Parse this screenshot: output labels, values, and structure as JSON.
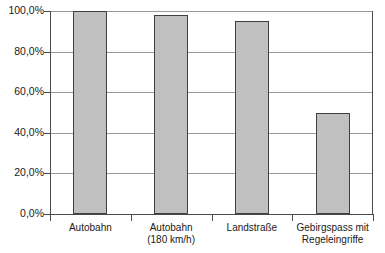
{
  "chart_data": {
    "type": "bar",
    "title": "",
    "subtitle": "",
    "xlabel": "",
    "ylabel": "",
    "categories": [
      "Autobahn",
      "Autobahn (180 km/h)",
      "Landstraße",
      "Gebirgspass mit Regeleingriffe"
    ],
    "category_lines": [
      [
        "Autobahn"
      ],
      [
        "Autobahn",
        "(180 km/h)"
      ],
      [
        "Landstraße"
      ],
      [
        "Gebirgspass mit",
        "Regeleingriffe"
      ]
    ],
    "values": [
      100.0,
      98.0,
      95.0,
      50.0
    ],
    "value_labels": [
      "100,0%",
      "98,0%",
      "95,0%",
      "50,0%"
    ],
    "ylim": [
      0,
      100
    ],
    "ytick_values": [
      0,
      20,
      40,
      60,
      80,
      100
    ],
    "ytick_labels": [
      "0,0%",
      "20,0%",
      "40,0%",
      "60,0%",
      "80,0%",
      "100,0%"
    ],
    "grid": true,
    "legend": null,
    "legend_position": "none",
    "bar_color": "#c0c0c0",
    "bar_border_color": "#404040",
    "gridline_color": "#9a9a9a",
    "axis_color": "#4a4a4a",
    "background_color": "#ffffff"
  }
}
